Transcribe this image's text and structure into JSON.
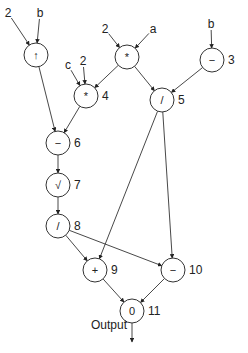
{
  "diagram": {
    "type": "computation-graph",
    "nodes": [
      {
        "id": "n1",
        "op": "↑",
        "number": "",
        "x": 36,
        "y": 55
      },
      {
        "id": "n2",
        "op": "*",
        "number": "",
        "x": 127,
        "y": 57
      },
      {
        "id": "n3",
        "op": "−",
        "number": "3",
        "x": 212,
        "y": 60
      },
      {
        "id": "n4",
        "op": "*",
        "number": "4",
        "x": 86,
        "y": 96
      },
      {
        "id": "n5",
        "op": "/",
        "number": "5",
        "x": 162,
        "y": 100
      },
      {
        "id": "n6",
        "op": "−",
        "number": "6",
        "x": 58,
        "y": 143
      },
      {
        "id": "n7",
        "op": "√",
        "number": "7",
        "x": 58,
        "y": 185
      },
      {
        "id": "n8",
        "op": "/",
        "number": "8",
        "x": 58,
        "y": 226
      },
      {
        "id": "n9",
        "op": "+",
        "number": "9",
        "x": 95,
        "y": 270
      },
      {
        "id": "n10",
        "op": "−",
        "number": "10",
        "x": 173,
        "y": 270
      },
      {
        "id": "n11",
        "op": "0",
        "number": "11",
        "x": 132,
        "y": 311
      }
    ],
    "inputs": [
      {
        "label": "2",
        "x": 8,
        "y": 13,
        "target": "n1"
      },
      {
        "label": "b",
        "x": 40,
        "y": 13,
        "target": "n1"
      },
      {
        "label": "2",
        "x": 105,
        "y": 29,
        "target": "n2"
      },
      {
        "label": "a",
        "x": 153,
        "y": 29,
        "target": "n2"
      },
      {
        "label": "b",
        "x": 211,
        "y": 24,
        "target": "n3"
      },
      {
        "label": "c",
        "x": 68,
        "y": 65,
        "target": "n4"
      },
      {
        "label": "2",
        "x": 83,
        "y": 61,
        "target": "n4"
      }
    ],
    "edges": [
      {
        "from": "n1",
        "to": "n6"
      },
      {
        "from": "n2",
        "to": "n4"
      },
      {
        "from": "n2",
        "to": "n5"
      },
      {
        "from": "n3",
        "to": "n5"
      },
      {
        "from": "n4",
        "to": "n6"
      },
      {
        "from": "n6",
        "to": "n7"
      },
      {
        "from": "n7",
        "to": "n8"
      },
      {
        "from": "n8",
        "to": "n9"
      },
      {
        "from": "n8",
        "to": "n10"
      },
      {
        "from": "n5",
        "to": "n9"
      },
      {
        "from": "n5",
        "to": "n10"
      },
      {
        "from": "n9",
        "to": "n11"
      },
      {
        "from": "n10",
        "to": "n11"
      }
    ],
    "output": {
      "label": "Output",
      "x": 109,
      "y": 325
    }
  }
}
